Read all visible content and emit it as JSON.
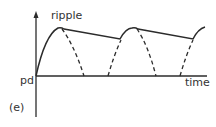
{
  "diagram": {
    "panel_label": "(e)",
    "y_axis_label": "pd",
    "x_axis_label": "time",
    "annotation": "ripple",
    "colors": {
      "line": "#2b2b2b",
      "background": "#ffffff"
    },
    "curves": {
      "smoothed_output": "solid line: rise to peak, slow linear decay, repeated",
      "rectified_halfwave": "dashed half-sine pulses below smoothed output"
    }
  }
}
